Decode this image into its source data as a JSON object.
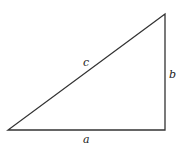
{
  "diagram": {
    "type": "right-triangle",
    "vertices": {
      "bottom_left": [
        8,
        130
      ],
      "bottom_right": [
        165,
        130
      ],
      "top_right": [
        165,
        14
      ]
    },
    "labels": {
      "hypotenuse": "c",
      "vertical_leg": "b",
      "horizontal_leg": "a"
    },
    "stroke_color": "#333333"
  }
}
